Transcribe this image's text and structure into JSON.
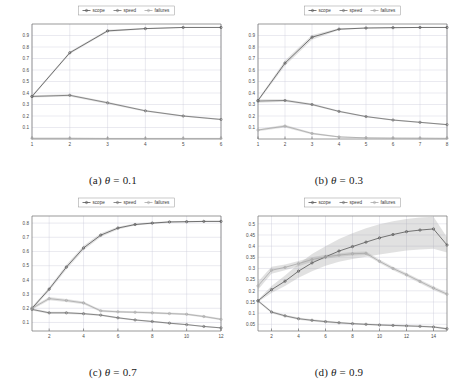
{
  "figure": {
    "background": "#ffffff",
    "legend_labels": [
      "scope",
      "speed",
      "failures"
    ],
    "series_colors": {
      "scope": "#555555",
      "speed": "#6e6e6e",
      "failures": "#a8a8a8"
    },
    "band_color": "#9a9a9a",
    "grid_color": "#c9c9d8",
    "axis_color": "#6f6f6f"
  },
  "chart_data": [
    {
      "type": "line",
      "panel": "a",
      "title": "(a) θ = 0.1",
      "caption_prefix": "(a)",
      "caption_symbol": "θ",
      "caption_value": "= 0.1",
      "xlabel": "",
      "ylabel": "",
      "x": [
        1,
        2,
        3,
        4,
        5,
        6
      ],
      "xlim": [
        1,
        6
      ],
      "ylim": [
        0,
        1.0
      ],
      "xticks": [
        1,
        2,
        3,
        4,
        5,
        6
      ],
      "yticks": [
        0.1,
        0.2,
        0.3,
        0.4,
        0.5,
        0.6,
        0.7,
        0.8,
        0.9
      ],
      "ytick_labels": [
        "0.1",
        "0.2",
        "0.3",
        "0.4",
        "0.5",
        "0.6",
        "0.7",
        "0.8",
        "0.9"
      ],
      "xtick_labels": [
        "1",
        "2",
        "3",
        "4",
        "5",
        "6"
      ],
      "grid": true,
      "legend_position": "top-center",
      "series": [
        {
          "name": "scope",
          "values": [
            0.37,
            0.75,
            0.94,
            0.96,
            0.97,
            0.97
          ],
          "band_low": [
            0.36,
            0.74,
            0.93,
            0.955,
            0.965,
            0.965
          ],
          "band_high": [
            0.38,
            0.76,
            0.95,
            0.965,
            0.975,
            0.975
          ]
        },
        {
          "name": "speed",
          "values": [
            0.37,
            0.38,
            0.315,
            0.245,
            0.2,
            0.17
          ],
          "band_low": [
            0.36,
            0.37,
            0.305,
            0.238,
            0.194,
            0.164
          ],
          "band_high": [
            0.38,
            0.39,
            0.325,
            0.252,
            0.206,
            0.176
          ]
        },
        {
          "name": "failures",
          "values": [
            0.006,
            0.006,
            0.005,
            0.005,
            0.005,
            0.005
          ],
          "band_low": [
            0.003,
            0.003,
            0.003,
            0.003,
            0.003,
            0.003
          ],
          "band_high": [
            0.01,
            0.01,
            0.008,
            0.008,
            0.008,
            0.008
          ]
        }
      ]
    },
    {
      "type": "line",
      "panel": "b",
      "title": "(b) θ = 0.3",
      "caption_prefix": "(b)",
      "caption_symbol": "θ",
      "caption_value": "= 0.3",
      "xlabel": "",
      "ylabel": "",
      "x": [
        1,
        2,
        3,
        4,
        5,
        6,
        7,
        8
      ],
      "xlim": [
        1,
        8
      ],
      "ylim": [
        0,
        1.0
      ],
      "xticks": [
        1,
        2,
        3,
        4,
        5,
        6,
        7,
        8
      ],
      "yticks": [
        0.1,
        0.2,
        0.3,
        0.4,
        0.5,
        0.6,
        0.7,
        0.8,
        0.9
      ],
      "ytick_labels": [
        "0.1",
        "0.2",
        "0.3",
        "0.4",
        "0.5",
        "0.6",
        "0.7",
        "0.8",
        "0.9"
      ],
      "xtick_labels": [
        "1",
        "2",
        "3",
        "4",
        "5",
        "6",
        "7",
        "8"
      ],
      "grid": true,
      "legend_position": "top-center",
      "series": [
        {
          "name": "scope",
          "values": [
            0.335,
            0.66,
            0.885,
            0.955,
            0.965,
            0.968,
            0.97,
            0.97
          ],
          "band_low": [
            0.325,
            0.638,
            0.862,
            0.948,
            0.96,
            0.963,
            0.965,
            0.965
          ],
          "band_high": [
            0.345,
            0.682,
            0.905,
            0.962,
            0.97,
            0.973,
            0.975,
            0.975
          ]
        },
        {
          "name": "speed",
          "values": [
            0.33,
            0.335,
            0.3,
            0.24,
            0.195,
            0.165,
            0.145,
            0.125
          ],
          "band_low": [
            0.315,
            0.325,
            0.292,
            0.233,
            0.189,
            0.159,
            0.139,
            0.119
          ],
          "band_high": [
            0.345,
            0.345,
            0.308,
            0.247,
            0.201,
            0.171,
            0.151,
            0.131
          ]
        },
        {
          "name": "failures",
          "values": [
            0.078,
            0.112,
            0.048,
            0.018,
            0.01,
            0.008,
            0.007,
            0.006
          ],
          "band_low": [
            0.068,
            0.1,
            0.04,
            0.013,
            0.006,
            0.005,
            0.004,
            0.003
          ],
          "band_high": [
            0.088,
            0.124,
            0.056,
            0.024,
            0.014,
            0.011,
            0.01,
            0.009
          ]
        }
      ]
    },
    {
      "type": "line",
      "panel": "c",
      "title": "(c) θ = 0.7",
      "caption_prefix": "(c)",
      "caption_symbol": "θ",
      "caption_value": "= 0.7",
      "xlabel": "",
      "ylabel": "",
      "x": [
        1,
        2,
        3,
        4,
        5,
        6,
        7,
        8,
        9,
        10,
        11,
        12
      ],
      "xlim": [
        1,
        12
      ],
      "ylim": [
        0.04,
        0.85
      ],
      "xticks": [
        2,
        4,
        6,
        8,
        10,
        12
      ],
      "yticks": [
        0.1,
        0.2,
        0.3,
        0.4,
        0.5,
        0.6,
        0.7,
        0.8
      ],
      "ytick_labels": [
        "0.1",
        "0.2",
        "0.3",
        "0.4",
        "0.5",
        "0.6",
        "0.7",
        "0.8"
      ],
      "xtick_labels": [
        "2",
        "4",
        "6",
        "8",
        "10",
        "12"
      ],
      "grid": true,
      "legend_position": "top-center",
      "series": [
        {
          "name": "scope",
          "values": [
            0.2,
            0.335,
            0.49,
            0.625,
            0.715,
            0.765,
            0.79,
            0.8,
            0.808,
            0.81,
            0.812,
            0.812
          ],
          "band_low": [
            0.19,
            0.322,
            0.474,
            0.609,
            0.702,
            0.755,
            0.783,
            0.794,
            0.802,
            0.805,
            0.807,
            0.807
          ],
          "band_high": [
            0.21,
            0.348,
            0.506,
            0.641,
            0.728,
            0.775,
            0.797,
            0.806,
            0.814,
            0.815,
            0.817,
            0.817
          ]
        },
        {
          "name": "speed",
          "values": [
            0.192,
            0.168,
            0.168,
            0.162,
            0.152,
            0.133,
            0.118,
            0.107,
            0.095,
            0.085,
            0.072,
            0.062
          ],
          "band_low": [
            0.184,
            0.16,
            0.16,
            0.155,
            0.146,
            0.127,
            0.113,
            0.102,
            0.09,
            0.08,
            0.068,
            0.058
          ],
          "band_high": [
            0.2,
            0.176,
            0.176,
            0.169,
            0.158,
            0.139,
            0.123,
            0.112,
            0.1,
            0.09,
            0.076,
            0.066
          ]
        },
        {
          "name": "failures",
          "values": [
            0.2,
            0.268,
            0.255,
            0.238,
            0.182,
            0.175,
            0.172,
            0.168,
            0.163,
            0.158,
            0.142,
            0.122
          ],
          "band_low": [
            0.19,
            0.256,
            0.244,
            0.228,
            0.174,
            0.168,
            0.165,
            0.161,
            0.156,
            0.151,
            0.135,
            0.115
          ],
          "band_high": [
            0.21,
            0.28,
            0.266,
            0.248,
            0.19,
            0.182,
            0.179,
            0.175,
            0.17,
            0.165,
            0.149,
            0.129
          ]
        }
      ]
    },
    {
      "type": "line",
      "panel": "d",
      "title": "(d) θ = 0.9",
      "caption_prefix": "(d)",
      "caption_symbol": "θ",
      "caption_value": "= 0.9",
      "xlabel": "",
      "ylabel": "",
      "x": [
        1,
        2,
        3,
        4,
        5,
        6,
        7,
        8,
        9,
        10,
        11,
        12,
        13,
        14,
        15
      ],
      "xlim": [
        1,
        15
      ],
      "ylim": [
        0.02,
        0.535
      ],
      "xticks": [
        2,
        4,
        6,
        8,
        10,
        12,
        14
      ],
      "yticks": [
        0.05,
        0.1,
        0.15,
        0.2,
        0.25,
        0.3,
        0.35,
        0.4,
        0.45,
        0.5
      ],
      "ytick_labels": [
        "0.05",
        "0.1",
        "0.15",
        "0.2",
        "0.25",
        "0.3",
        "0.35",
        "0.4",
        "0.45",
        "0.5"
      ],
      "xtick_labels": [
        "2",
        "4",
        "6",
        "8",
        "10",
        "12",
        "14"
      ],
      "grid": true,
      "legend_position": "top-center",
      "series": [
        {
          "name": "scope",
          "values": [
            0.155,
            0.205,
            0.243,
            0.288,
            0.325,
            0.352,
            0.378,
            0.398,
            0.418,
            0.437,
            0.452,
            0.465,
            0.472,
            0.477,
            0.405
          ],
          "band_low": [
            0.15,
            0.19,
            0.222,
            0.258,
            0.288,
            0.312,
            0.33,
            0.342,
            0.352,
            0.363,
            0.372,
            0.38,
            0.385,
            0.388,
            0.372
          ],
          "band_high": [
            0.16,
            0.222,
            0.268,
            0.32,
            0.365,
            0.4,
            0.432,
            0.458,
            0.48,
            0.498,
            0.512,
            0.522,
            0.528,
            0.532,
            0.44
          ]
        },
        {
          "name": "speed",
          "values": [
            0.155,
            0.105,
            0.088,
            0.075,
            0.068,
            0.062,
            0.057,
            0.053,
            0.05,
            0.047,
            0.045,
            0.043,
            0.041,
            0.038,
            0.03
          ],
          "band_low": [
            0.15,
            0.099,
            0.083,
            0.07,
            0.063,
            0.057,
            0.053,
            0.049,
            0.046,
            0.043,
            0.041,
            0.039,
            0.037,
            0.034,
            0.026
          ],
          "band_high": [
            0.16,
            0.111,
            0.093,
            0.08,
            0.073,
            0.067,
            0.061,
            0.057,
            0.054,
            0.051,
            0.049,
            0.047,
            0.045,
            0.042,
            0.034
          ]
        },
        {
          "name": "failures",
          "values": [
            0.222,
            0.292,
            0.305,
            0.322,
            0.34,
            0.352,
            0.36,
            0.366,
            0.368,
            0.332,
            0.3,
            0.272,
            0.242,
            0.212,
            0.185
          ],
          "band_low": [
            0.205,
            0.276,
            0.292,
            0.31,
            0.33,
            0.343,
            0.352,
            0.358,
            0.36,
            0.324,
            0.292,
            0.264,
            0.234,
            0.204,
            0.178
          ],
          "band_high": [
            0.24,
            0.308,
            0.318,
            0.334,
            0.35,
            0.361,
            0.368,
            0.374,
            0.376,
            0.34,
            0.308,
            0.28,
            0.25,
            0.22,
            0.192
          ]
        }
      ]
    }
  ]
}
